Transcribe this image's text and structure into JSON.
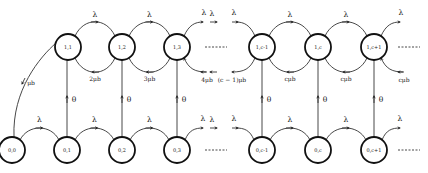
{
  "diagram": {
    "top_row": {
      "nodes": [
        {
          "id": "1,1",
          "x": 68
        },
        {
          "id": "1,2",
          "x": 122
        },
        {
          "id": "1,3",
          "x": 177
        },
        {
          "id": "1,c-1",
          "x": 262
        },
        {
          "id": "1,c",
          "x": 318
        },
        {
          "id": "1,c+1",
          "x": 374
        }
      ],
      "y": 47,
      "forward_rate": "λ",
      "backward_rates": [
        "2μb",
        "3μb",
        "4μb",
        "(c − 1)μb",
        "cμb",
        "cμb",
        "cμb"
      ]
    },
    "bottom_row": {
      "nodes": [
        {
          "id": "0,0",
          "x": 12
        },
        {
          "id": "0,1",
          "x": 67
        },
        {
          "id": "0,2",
          "x": 122
        },
        {
          "id": "0,3",
          "x": 177
        },
        {
          "id": "0,c-1",
          "x": 262
        },
        {
          "id": "0,c",
          "x": 318
        },
        {
          "id": "0,c+1",
          "x": 374
        }
      ],
      "y": 150,
      "forward_rate": "λ"
    },
    "vertical_rate": "θ",
    "return_rate": "μb",
    "ellipsis": "-------"
  }
}
